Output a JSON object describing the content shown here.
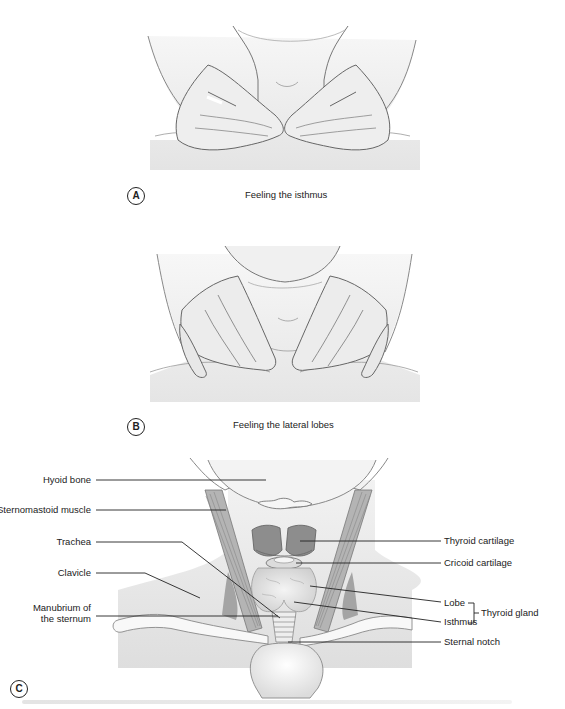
{
  "figure": {
    "panels": [
      {
        "id": "A",
        "letter": "A",
        "caption": "Feeling the isthmus"
      },
      {
        "id": "B",
        "letter": "B",
        "caption": "Feeling the lateral lobes"
      },
      {
        "id": "C",
        "letter": "C",
        "caption": ""
      }
    ],
    "anatomy_labels": {
      "left": [
        {
          "text": "Hyoid bone"
        },
        {
          "text": "Sternomastoid muscle"
        },
        {
          "text": "Trachea"
        },
        {
          "text": "Clavicle"
        },
        {
          "text_line1": "Manubrium of",
          "text_line2": "the sternum"
        }
      ],
      "right": [
        {
          "text": "Thyroid cartilage"
        },
        {
          "text": "Cricoid cartilage"
        },
        {
          "text": "Lobe"
        },
        {
          "text": "Isthmus"
        },
        {
          "text": "Sternal notch"
        }
      ],
      "group_bracket": {
        "text": "Thyroid gland",
        "members": [
          "Lobe",
          "Isthmus"
        ]
      }
    },
    "colors": {
      "line": "#222222",
      "skin_fill": "#ececec",
      "skin_shadow": "#dcdcdc",
      "cartilage": "#8d8d8d",
      "muscle": "#9a9a9a",
      "gland": "#d9d9d9"
    }
  }
}
